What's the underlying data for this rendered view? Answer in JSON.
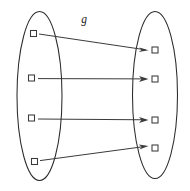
{
  "diagram": {
    "function_label": "g",
    "function_label_position": {
      "x": 84,
      "y": 22
    },
    "stroke_color": "#3a3a3a",
    "ellipse_stroke_color": "#2b2b2b",
    "background_color": "#ffffff",
    "canvas": {
      "width": 190,
      "height": 191
    },
    "sets": [
      {
        "name": "domain-set",
        "side": "left",
        "ellipse": {
          "cx": 39.5,
          "cy": 96,
          "rx": 22.5,
          "ry": 84.5
        },
        "elements": [
          {
            "name": "domain-element-1",
            "x": 33.5,
            "y": 33.5
          },
          {
            "name": "domain-element-2",
            "x": 31.5,
            "y": 78.0
          },
          {
            "name": "domain-element-3",
            "x": 31.5,
            "y": 118.0
          },
          {
            "name": "domain-element-4",
            "x": 34.5,
            "y": 161.5
          }
        ]
      },
      {
        "name": "codomain-set",
        "side": "right",
        "ellipse": {
          "cx": 155.0,
          "cy": 95,
          "rx": 22.5,
          "ry": 83.5
        },
        "elements": [
          {
            "name": "codomain-element-1",
            "x": 155.0,
            "y": 50.0
          },
          {
            "name": "codomain-element-2",
            "x": 155.0,
            "y": 79.0
          },
          {
            "name": "codomain-element-3",
            "x": 155.0,
            "y": 120.0
          },
          {
            "name": "codomain-element-4",
            "x": 155.0,
            "y": 148.0
          }
        ]
      }
    ],
    "element_size": 6,
    "mappings": [
      {
        "name": "mapping-arrow-1",
        "from": 1,
        "to": 1,
        "x1": 40,
        "y1": 34.5,
        "x2": 147,
        "y2": 50.0
      },
      {
        "name": "mapping-arrow-2",
        "from": 2,
        "to": 2,
        "x1": 38,
        "y1": 78.5,
        "x2": 147,
        "y2": 79.0
      },
      {
        "name": "mapping-arrow-3",
        "from": 3,
        "to": 3,
        "x1": 38,
        "y1": 118.5,
        "x2": 147,
        "y2": 120.0
      },
      {
        "name": "mapping-arrow-4",
        "from": 4,
        "to": 4,
        "x1": 41,
        "y1": 161.0,
        "x2": 147,
        "y2": 146.0
      }
    ]
  }
}
